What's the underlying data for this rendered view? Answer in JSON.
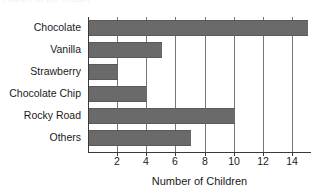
{
  "clipped_title": "Flavors of Ice Cream",
  "chart_data": {
    "type": "bar",
    "orientation": "horizontal",
    "title": "",
    "xlabel": "Number of Children",
    "ylabel": "",
    "categories": [
      "Chocolate",
      "Vanilla",
      "Strawberry",
      "Chocolate Chip",
      "Rocky Road",
      "Others"
    ],
    "values": [
      15,
      5,
      2,
      4,
      10,
      7
    ],
    "xlim": [
      0,
      15.3
    ],
    "xticks": [
      2,
      4,
      6,
      8,
      10,
      12,
      14
    ],
    "xtick_labels": [
      "2",
      "4",
      "6",
      "8",
      "10",
      "12",
      "14"
    ],
    "gridlines": "vertical",
    "legend": "none",
    "bar_color": "#6a6a6a",
    "axis_color": "#3a3a3a",
    "grid_color": "#777777",
    "background": "#ffffff"
  }
}
